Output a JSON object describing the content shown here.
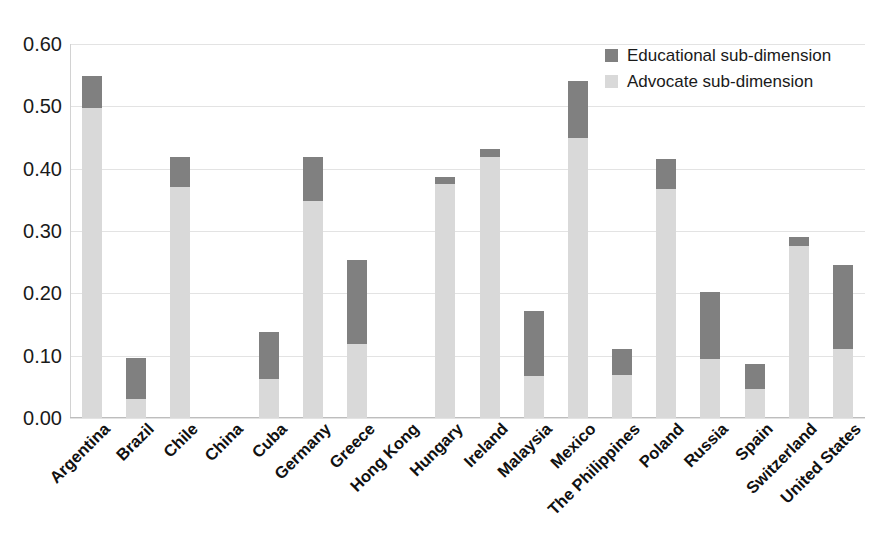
{
  "chart_data": {
    "type": "bar",
    "subtype": "stacked-vertical",
    "title": "",
    "xlabel": "",
    "ylabel": "",
    "ylim": [
      0.0,
      0.6
    ],
    "ytick_step": 0.1,
    "ytick_labels": [
      "0.00",
      "0.10",
      "0.20",
      "0.30",
      "0.40",
      "0.50",
      "0.60"
    ],
    "ytick_values": [
      0.0,
      0.1,
      0.2,
      0.3,
      0.4,
      0.5,
      0.6
    ],
    "grid": true,
    "grid_axis": "y",
    "legend_position": "top-right-inside",
    "categories": [
      "Argentina",
      "Brazil",
      "Chile",
      "China",
      "Cuba",
      "Germany",
      "Greece",
      "Hong Kong",
      "Hungary",
      "Ireland",
      "Malaysia",
      "Mexico",
      "The Philippines",
      "Poland",
      "Russia",
      "Spain",
      "Switzerland",
      "United States"
    ],
    "series": [
      {
        "name": "Advocate sub-dimension",
        "color": "#d9d9d9",
        "values": [
          0.497,
          0.03,
          0.37,
          0.0,
          0.063,
          0.348,
          0.118,
          0.0,
          0.375,
          0.419,
          0.067,
          0.449,
          0.069,
          0.368,
          0.095,
          0.046,
          0.276,
          0.111
        ]
      },
      {
        "name": "Educational sub-dimension",
        "color": "#808080",
        "values": [
          0.051,
          0.066,
          0.048,
          0.0,
          0.075,
          0.071,
          0.136,
          0.0,
          0.012,
          0.012,
          0.105,
          0.092,
          0.042,
          0.048,
          0.107,
          0.041,
          0.015,
          0.134
        ]
      }
    ],
    "totals": [
      0.548,
      0.096,
      0.418,
      0.0,
      0.138,
      0.419,
      0.254,
      0.0,
      0.387,
      0.431,
      0.172,
      0.541,
      0.111,
      0.416,
      0.202,
      0.087,
      0.291,
      0.245
    ]
  },
  "legend": {
    "items": [
      {
        "label": "Educational sub-dimension",
        "color": "#808080"
      },
      {
        "label": "Advocate sub-dimension",
        "color": "#d9d9d9"
      }
    ]
  },
  "colors": {
    "educational": "#808080",
    "advocate": "#d9d9d9",
    "gridline": "#e3e3e3",
    "text": "#1a1a1a",
    "background": "#ffffff"
  }
}
